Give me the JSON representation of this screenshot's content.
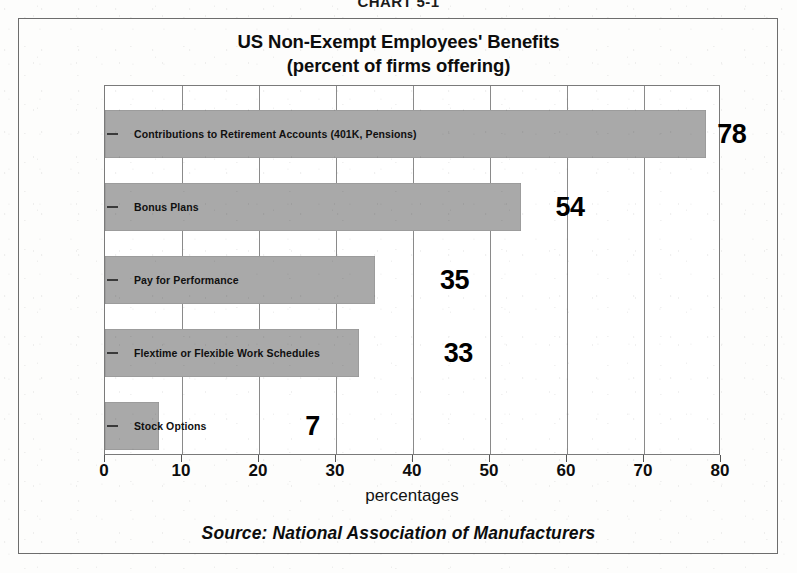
{
  "caption": "CHART 5-1",
  "source_note": "Source:  National Association of Manufacturers",
  "chart_data": {
    "type": "bar",
    "orientation": "horizontal",
    "title": "US Non-Exempt Employees' Benefits",
    "subtitle": "(percent of firms offering)",
    "xlabel": "percentages",
    "ylabel": "",
    "xlim": [
      0,
      80
    ],
    "xticks": [
      0,
      10,
      20,
      30,
      40,
      50,
      60,
      70,
      80
    ],
    "xtick_labels": [
      "0",
      "10",
      "20",
      "30",
      "40",
      "50",
      "60",
      "70",
      "80"
    ],
    "grid": true,
    "legend": false,
    "bar_color": "#a9a9a9",
    "categories": [
      "Contributions to Retirement Accounts (401K, Pensions)",
      "Bonus Plans",
      "Pay for Performance",
      "Flextime or Flexible Work Schedules",
      "Stock Options"
    ],
    "values": [
      78,
      54,
      35,
      33,
      7
    ],
    "value_labels": [
      "78",
      "54",
      "35",
      "33",
      "7"
    ],
    "label_x_positions": [
      79.5,
      58.5,
      43.5,
      44.0,
      26.0
    ]
  }
}
